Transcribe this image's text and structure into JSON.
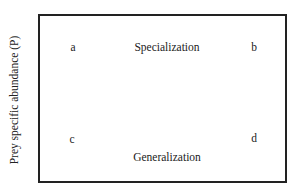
{
  "diagram": {
    "y_axis_label": "Prey specific abundance (P)",
    "corners": {
      "top_left": "a",
      "top_right": "b",
      "bottom_left": "c",
      "bottom_right": "d"
    },
    "top_label": "Specialization",
    "bottom_label": "Generalization"
  }
}
